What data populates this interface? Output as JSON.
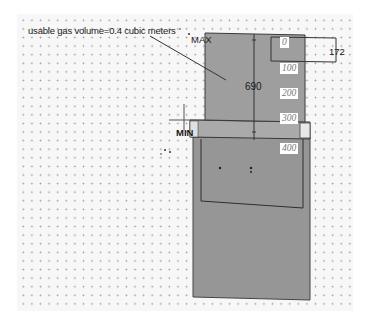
{
  "diagram": {
    "annotation": "usable gas volume=0.4 cubic meters",
    "labels": {
      "max": "MAX",
      "min": "MIN",
      "height_dimension": "690",
      "width_dimension": "172"
    },
    "scale_ticks": [
      "0",
      "100",
      "200",
      "300",
      "400"
    ],
    "colors": {
      "background": "#ffffff",
      "grid_dots": "#9a9a9a",
      "gas_holder_fill": "#9c9c9c",
      "tank_fill": "#959595",
      "middle_band_fill": "#a8a8a8",
      "outline": "#3a3a3a"
    }
  }
}
